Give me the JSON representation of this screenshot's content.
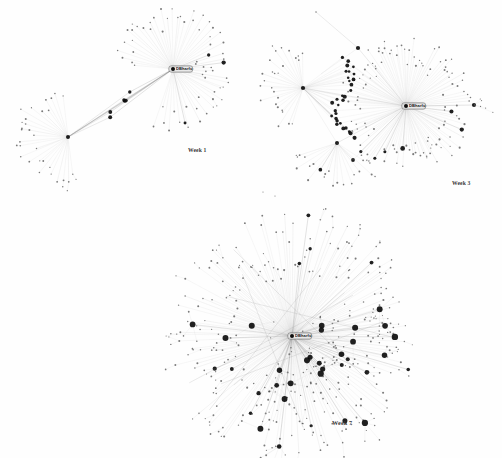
{
  "figure": {
    "background_color": "#fefefe",
    "width": 502,
    "height": 458,
    "node_color": "#4a4a4a",
    "hub_color": "#0d0d0d",
    "edge_color": "#b9b9b9",
    "edge_color_dark": "#8d8d8d",
    "label_text_color": "#111111",
    "caption_color": "#3a3a3a"
  },
  "panels": [
    {
      "id": "week-1",
      "caption": "Week 1",
      "caption_x": 188,
      "caption_y": 151,
      "hub_label": "DBharfu",
      "hub_x": 173,
      "hub_y": 69,
      "node_count": 96,
      "edge_count": 98,
      "description": "Two star hubs joined by a bridge with a small cluster of dark nodes midway"
    },
    {
      "id": "week-3",
      "caption": "Week 3",
      "caption_x": 456,
      "caption_y": 184,
      "hub_label": "DBharfu",
      "hub_x": 406,
      "hub_y": 106,
      "node_count": 228,
      "edge_count": 236,
      "description": "Large right star hub plus a secondary left hub and a dense mid-cluster of dark nodes"
    },
    {
      "id": "week-7",
      "caption": "Week 7",
      "caption_x": 336,
      "caption_y": 424,
      "hub_label": "DBharfu",
      "hub_x": 292,
      "hub_y": 336,
      "node_count": 392,
      "edge_count": 404,
      "description": "Very large dense radial star network with many secondary dark hubs in lower-left quadrant"
    }
  ],
  "chart_data": {
    "type": "scatter",
    "series": [
      {
        "name": "Week 1",
        "nodes": 96,
        "edges": 98,
        "hubs": 2
      },
      {
        "name": "Week 3",
        "nodes": 228,
        "edges": 236,
        "hubs": 4
      },
      {
        "name": "Week 7",
        "nodes": 392,
        "edges": 404,
        "hubs": 1
      }
    ],
    "categories": [
      "Week 1",
      "Week 3",
      "Week 7"
    ],
    "values": [
      96,
      228,
      392
    ],
    "xlabel": "",
    "ylabel": "",
    "legend": false,
    "grid": false
  }
}
